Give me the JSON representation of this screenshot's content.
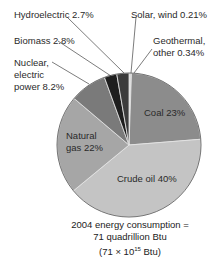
{
  "chart_data": {
    "type": "pie",
    "title": "",
    "categories": [
      "Coal",
      "Crude oil",
      "Natural gas",
      "Nuclear, electric power",
      "Biomass",
      "Hydroelectric",
      "Solar, wind",
      "Geothermal, other"
    ],
    "values": [
      23,
      40,
      22,
      8.2,
      2.8,
      2.7,
      0.21,
      0.34
    ],
    "unit": "%",
    "labels": {
      "coal": "Coal 23%",
      "crude_oil": "Crude oil 40%",
      "natural_gas_1": "Natural",
      "natural_gas_2": "gas 22%",
      "nuclear_1": "Nuclear,",
      "nuclear_2": "electric",
      "nuclear_3": "power 8.2%",
      "biomass": "Biomass 2.8%",
      "hydro": "Hydroelectric 2.7%",
      "solar": "Solar, wind 0.21%",
      "geo_1": "Geothermal,",
      "geo_2": "other 0.34%"
    },
    "colors": {
      "coal": "#8c8c8c",
      "crude_oil": "#c4c4c4",
      "natural_gas": "#a6a6a6",
      "nuclear": "#7a7a7a",
      "biomass": "#1e1e1e",
      "hydro": "#3c3c3c",
      "solar": "#9a9a9a",
      "geothermal": "#d0d0d0"
    }
  },
  "caption": {
    "line1": "2004 energy consumption =",
    "line2": "71 quadrillion Btu",
    "line3_pre": "(71 × 10",
    "line3_sup": "15",
    "line3_post": " Btu)"
  }
}
